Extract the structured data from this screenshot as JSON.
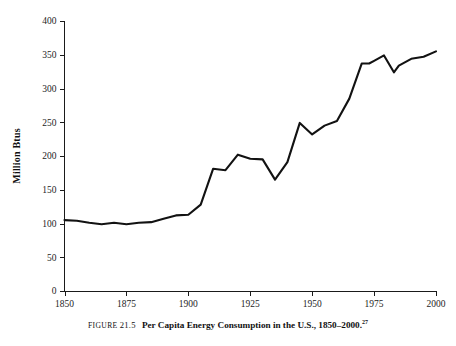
{
  "caption": {
    "figure_label": "FIGURE",
    "figure_number": "21.5",
    "title": "Per Capita Energy Consumption in the U.S., 1850–2000.",
    "footnote_marker": "27"
  },
  "chart_data": {
    "type": "line",
    "title": "",
    "xlabel": "",
    "ylabel": "Million Btus",
    "xlim": [
      1850,
      2000
    ],
    "ylim": [
      0,
      400
    ],
    "xticks": [
      1850,
      1875,
      1900,
      1925,
      1950,
      1975,
      2000
    ],
    "xtick_labels": [
      "1850",
      "1875",
      "1900",
      "1925",
      "1950",
      "1975",
      "2000"
    ],
    "yticks": [
      0,
      50,
      100,
      150,
      200,
      250,
      300,
      350,
      400
    ],
    "ytick_labels": [
      "0",
      "50",
      "100",
      "150",
      "200",
      "250",
      "300",
      "350",
      "400"
    ],
    "grid": false,
    "legend": false,
    "line_color": "#121212",
    "series": [
      {
        "name": "Per Capita Energy Consumption",
        "x": [
          1850,
          1855,
          1860,
          1865,
          1870,
          1875,
          1880,
          1885,
          1890,
          1895,
          1900,
          1905,
          1910,
          1915,
          1920,
          1925,
          1930,
          1935,
          1940,
          1945,
          1950,
          1955,
          1960,
          1965,
          1970,
          1973,
          1975,
          1979,
          1983,
          1985,
          1990,
          1995,
          2000
        ],
        "y": [
          105,
          104,
          101,
          99,
          101,
          99,
          101,
          102,
          107,
          112,
          113,
          128,
          181,
          179,
          202,
          196,
          195,
          165,
          191,
          249,
          232,
          245,
          252,
          285,
          337,
          337,
          341,
          349,
          324,
          334,
          344,
          347,
          355
        ]
      }
    ]
  }
}
